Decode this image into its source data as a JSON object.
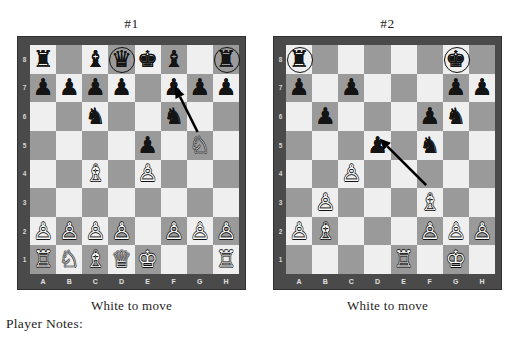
{
  "page": {
    "clipped_header": "",
    "player_notes_label": "Player Notes:"
  },
  "diagrams": [
    {
      "id": "diagram-1",
      "title": "#1",
      "caption": "White to move",
      "files": [
        "A",
        "B",
        "C",
        "D",
        "E",
        "F",
        "G",
        "H"
      ],
      "ranks": [
        "8",
        "7",
        "6",
        "5",
        "4",
        "3",
        "2",
        "1"
      ],
      "position": {
        "a8": {
          "piece": "black-rook",
          "glyph": "♜",
          "color": "black",
          "circled": false
        },
        "c8": {
          "piece": "black-bishop",
          "glyph": "♝",
          "color": "black",
          "circled": false
        },
        "d8": {
          "piece": "black-queen",
          "glyph": "♛",
          "color": "black",
          "circled": true
        },
        "e8": {
          "piece": "black-king",
          "glyph": "♚",
          "color": "black",
          "circled": false
        },
        "f8": {
          "piece": "black-bishop",
          "glyph": "♝",
          "color": "black",
          "circled": false
        },
        "h8": {
          "piece": "black-rook",
          "glyph": "♜",
          "color": "black",
          "circled": true
        },
        "a7": {
          "piece": "black-pawn",
          "glyph": "♟",
          "color": "black",
          "circled": false
        },
        "b7": {
          "piece": "black-pawn",
          "glyph": "♟",
          "color": "black",
          "circled": false
        },
        "c7": {
          "piece": "black-pawn",
          "glyph": "♟",
          "color": "black",
          "circled": false
        },
        "d7": {
          "piece": "black-pawn",
          "glyph": "♟",
          "color": "black",
          "circled": false
        },
        "f7": {
          "piece": "black-pawn",
          "glyph": "♟",
          "color": "black",
          "circled": false
        },
        "g7": {
          "piece": "black-pawn",
          "glyph": "♟",
          "color": "black",
          "circled": false
        },
        "h7": {
          "piece": "black-pawn",
          "glyph": "♟",
          "color": "black",
          "circled": false
        },
        "c6": {
          "piece": "black-knight",
          "glyph": "♞",
          "color": "black",
          "circled": false
        },
        "f6": {
          "piece": "black-knight",
          "glyph": "♞",
          "color": "black",
          "circled": false
        },
        "e5": {
          "piece": "black-pawn",
          "glyph": "♟",
          "color": "black",
          "circled": false
        },
        "g5": {
          "piece": "white-knight",
          "glyph": "♘",
          "color": "white",
          "circled": false
        },
        "c4": {
          "piece": "white-bishop",
          "glyph": "♗",
          "color": "white",
          "circled": false
        },
        "e4": {
          "piece": "white-pawn",
          "glyph": "♙",
          "color": "white",
          "circled": false
        },
        "a2": {
          "piece": "white-pawn",
          "glyph": "♙",
          "color": "white",
          "circled": false
        },
        "b2": {
          "piece": "white-pawn",
          "glyph": "♙",
          "color": "white",
          "circled": false
        },
        "c2": {
          "piece": "white-pawn",
          "glyph": "♙",
          "color": "white",
          "circled": false
        },
        "d2": {
          "piece": "white-pawn",
          "glyph": "♙",
          "color": "white",
          "circled": false
        },
        "f2": {
          "piece": "white-pawn",
          "glyph": "♙",
          "color": "white",
          "circled": false
        },
        "g2": {
          "piece": "white-pawn",
          "glyph": "♙",
          "color": "white",
          "circled": false
        },
        "h2": {
          "piece": "white-pawn",
          "glyph": "♙",
          "color": "white",
          "circled": false
        },
        "a1": {
          "piece": "white-rook",
          "glyph": "♖",
          "color": "white",
          "circled": false
        },
        "b1": {
          "piece": "white-knight",
          "glyph": "♘",
          "color": "white",
          "circled": false
        },
        "c1": {
          "piece": "white-bishop",
          "glyph": "♗",
          "color": "white",
          "circled": false
        },
        "d1": {
          "piece": "white-queen",
          "glyph": "♕",
          "color": "white",
          "circled": false
        },
        "e1": {
          "piece": "white-king",
          "glyph": "♔",
          "color": "white",
          "circled": false
        },
        "h1": {
          "piece": "white-rook",
          "glyph": "♖",
          "color": "white",
          "circled": false
        }
      },
      "arrow": {
        "from": "g5",
        "to": "f7"
      }
    },
    {
      "id": "diagram-2",
      "title": "#2",
      "caption": "White to move",
      "files": [
        "A",
        "B",
        "C",
        "D",
        "E",
        "F",
        "G",
        "H"
      ],
      "ranks": [
        "8",
        "7",
        "6",
        "5",
        "4",
        "3",
        "2",
        "1"
      ],
      "position": {
        "a8": {
          "piece": "black-rook",
          "glyph": "♜",
          "color": "black",
          "circled": true
        },
        "g8": {
          "piece": "black-king",
          "glyph": "♚",
          "color": "black",
          "circled": true
        },
        "a7": {
          "piece": "black-pawn",
          "glyph": "♟",
          "color": "black",
          "circled": false
        },
        "c7": {
          "piece": "black-pawn",
          "glyph": "♟",
          "color": "black",
          "circled": false
        },
        "g7": {
          "piece": "black-pawn",
          "glyph": "♟",
          "color": "black",
          "circled": false
        },
        "h7": {
          "piece": "black-pawn",
          "glyph": "♟",
          "color": "black",
          "circled": false
        },
        "b6": {
          "piece": "black-pawn",
          "glyph": "♟",
          "color": "black",
          "circled": false
        },
        "f6": {
          "piece": "black-pawn",
          "glyph": "♟",
          "color": "black",
          "circled": false
        },
        "g6": {
          "piece": "black-knight",
          "glyph": "♞",
          "color": "black",
          "circled": false
        },
        "d5": {
          "piece": "black-pawn",
          "glyph": "♟",
          "color": "black",
          "circled": false
        },
        "f5": {
          "piece": "black-knight",
          "glyph": "♞",
          "color": "black",
          "circled": false
        },
        "c4": {
          "piece": "white-pawn",
          "glyph": "♙",
          "color": "white",
          "circled": false
        },
        "b3": {
          "piece": "white-pawn",
          "glyph": "♙",
          "color": "white",
          "circled": false
        },
        "f3": {
          "piece": "white-bishop",
          "glyph": "♗",
          "color": "white",
          "circled": false
        },
        "a2": {
          "piece": "white-pawn",
          "glyph": "♙",
          "color": "white",
          "circled": false
        },
        "b2": {
          "piece": "white-bishop",
          "glyph": "♗",
          "color": "white",
          "circled": false
        },
        "f2": {
          "piece": "white-pawn",
          "glyph": "♙",
          "color": "white",
          "circled": false
        },
        "g2": {
          "piece": "white-pawn",
          "glyph": "♙",
          "color": "white",
          "circled": false
        },
        "h2": {
          "piece": "white-pawn",
          "glyph": "♙",
          "color": "white",
          "circled": false
        },
        "e1": {
          "piece": "white-rook",
          "glyph": "♖",
          "color": "white",
          "circled": false
        },
        "g1": {
          "piece": "white-king",
          "glyph": "♔",
          "color": "white",
          "circled": false
        }
      },
      "arrow": {
        "from": "f3",
        "to": "d5"
      }
    }
  ],
  "colors": {
    "light_square": "#efefef",
    "dark_square": "#9a9a9a",
    "frame": "#4a4a4a",
    "arrow": "#000000",
    "text": "#1d1d1d"
  }
}
